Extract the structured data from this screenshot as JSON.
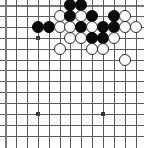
{
  "diagram": {
    "kind": "go-board-diagram",
    "board_size_visible": {
      "columns": 13,
      "rows": 13
    },
    "geometry": {
      "origin_x": 5,
      "origin_y": 5,
      "spacing": 10.9,
      "stone_diameter": 12,
      "width": 144,
      "height": 148
    },
    "colors": {
      "background": "#fefefe",
      "grid_line": "#5a5a5a",
      "board_edge": "#7a7a7a",
      "black_stone": "#0b0b0b",
      "white_stone": "#fcfcfc",
      "white_stone_outline": "#2b2b2b",
      "hoshi": "#3b3b3b"
    },
    "edges": {
      "top": true,
      "left": true,
      "right": false,
      "bottom": false
    },
    "hoshi_points": [
      {
        "col": 3,
        "row": 3
      },
      {
        "col": 3,
        "row": 10
      },
      {
        "col": 9,
        "row": 10
      }
    ],
    "stones": [
      {
        "color": "black",
        "col": 6,
        "row": 0
      },
      {
        "color": "black",
        "col": 7,
        "row": 0
      },
      {
        "color": "white",
        "col": 5,
        "row": 1
      },
      {
        "color": "black",
        "col": 6,
        "row": 1
      },
      {
        "color": "white",
        "col": 7,
        "row": 1
      },
      {
        "color": "black",
        "col": 8,
        "row": 1
      },
      {
        "color": "black",
        "col": 10,
        "row": 1
      },
      {
        "color": "white",
        "col": 11,
        "row": 1
      },
      {
        "color": "black",
        "col": 3,
        "row": 2
      },
      {
        "color": "black",
        "col": 4,
        "row": 2
      },
      {
        "color": "white",
        "col": 5,
        "row": 2
      },
      {
        "color": "white",
        "col": 6,
        "row": 2
      },
      {
        "color": "black",
        "col": 7,
        "row": 2
      },
      {
        "color": "white",
        "col": 8,
        "row": 2
      },
      {
        "color": "black",
        "col": 9,
        "row": 2
      },
      {
        "color": "black",
        "col": 10,
        "row": 2
      },
      {
        "color": "white",
        "col": 11,
        "row": 2
      },
      {
        "color": "white",
        "col": 12,
        "row": 2
      },
      {
        "color": "white",
        "col": 6,
        "row": 3
      },
      {
        "color": "white",
        "col": 7,
        "row": 3
      },
      {
        "color": "black",
        "col": 8,
        "row": 3
      },
      {
        "color": "black",
        "col": 9,
        "row": 3
      },
      {
        "color": "white",
        "col": 10,
        "row": 3
      },
      {
        "color": "white",
        "col": 5,
        "row": 4
      },
      {
        "color": "white",
        "col": 8,
        "row": 4
      },
      {
        "color": "white",
        "col": 9,
        "row": 4
      },
      {
        "color": "white",
        "col": 11,
        "row": 5
      }
    ]
  }
}
